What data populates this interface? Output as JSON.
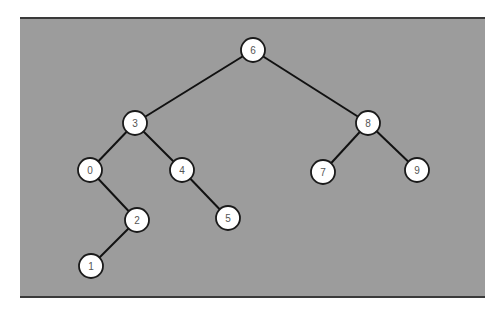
{
  "diagram": {
    "type": "binary-search-tree",
    "background_color": "#9c9c9c",
    "node_fill": "#ffffff",
    "root": "6",
    "nodes": [
      {
        "id": "6",
        "label": "6",
        "x": 253,
        "y": 50
      },
      {
        "id": "3",
        "label": "3",
        "x": 135,
        "y": 123
      },
      {
        "id": "8",
        "label": "8",
        "x": 368,
        "y": 123
      },
      {
        "id": "0",
        "label": "0",
        "x": 90,
        "y": 170
      },
      {
        "id": "4",
        "label": "4",
        "x": 182,
        "y": 170
      },
      {
        "id": "7",
        "label": "7",
        "x": 323,
        "y": 172
      },
      {
        "id": "9",
        "label": "9",
        "x": 417,
        "y": 170
      },
      {
        "id": "2",
        "label": "2",
        "x": 137,
        "y": 220
      },
      {
        "id": "5",
        "label": "5",
        "x": 228,
        "y": 218
      },
      {
        "id": "1",
        "label": "1",
        "x": 91,
        "y": 266
      }
    ],
    "edges": [
      {
        "from": "6",
        "to": "3"
      },
      {
        "from": "6",
        "to": "8"
      },
      {
        "from": "3",
        "to": "0"
      },
      {
        "from": "3",
        "to": "4"
      },
      {
        "from": "8",
        "to": "7"
      },
      {
        "from": "8",
        "to": "9"
      },
      {
        "from": "0",
        "to": "2"
      },
      {
        "from": "4",
        "to": "5"
      },
      {
        "from": "2",
        "to": "1"
      }
    ]
  }
}
